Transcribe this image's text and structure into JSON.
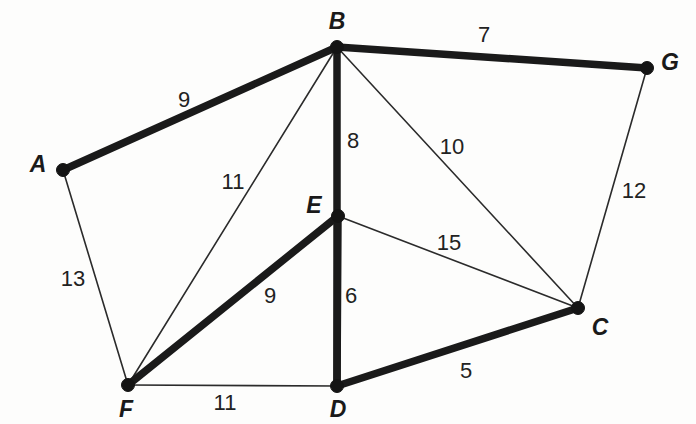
{
  "figure": {
    "type": "weighted-undirected-graph",
    "width": 696,
    "height": 424,
    "background_color": "#fdfdfc",
    "ink_color": "#1a1a1a"
  },
  "vertices": [
    {
      "id": "A",
      "label": "A",
      "x": 63,
      "y": 170,
      "label_x": 38,
      "label_y": 164
    },
    {
      "id": "B",
      "label": "B",
      "x": 337,
      "y": 47,
      "label_x": 337,
      "label_y": 21
    },
    {
      "id": "C",
      "label": "C",
      "x": 578,
      "y": 308,
      "label_x": 600,
      "label_y": 327
    },
    {
      "id": "D",
      "label": "D",
      "x": 337,
      "y": 386,
      "label_x": 338,
      "label_y": 409
    },
    {
      "id": "E",
      "label": "E",
      "x": 338,
      "y": 216,
      "label_x": 314,
      "label_y": 205
    },
    {
      "id": "F",
      "label": "F",
      "x": 128,
      "y": 385,
      "label_x": 126,
      "label_y": 409
    },
    {
      "id": "G",
      "label": "G",
      "x": 647,
      "y": 68,
      "label_x": 670,
      "label_y": 62
    }
  ],
  "edges": [
    {
      "from": "A",
      "to": "B",
      "weight": 9,
      "weight_x": 184,
      "weight_y": 100,
      "style": "thick"
    },
    {
      "from": "B",
      "to": "G",
      "weight": 7,
      "weight_x": 484,
      "weight_y": 35,
      "style": "thick"
    },
    {
      "from": "B",
      "to": "D",
      "weight": 8,
      "weight_x": 353,
      "weight_y": 141,
      "style": "thick"
    },
    {
      "from": "E",
      "to": "F",
      "weight": 9,
      "weight_x": 270,
      "weight_y": 296,
      "style": "thick"
    },
    {
      "from": "E",
      "to": "D",
      "weight": 6,
      "weight_x": 351,
      "weight_y": 296,
      "style": "thick"
    },
    {
      "from": "D",
      "to": "C",
      "weight": 5,
      "weight_x": 466,
      "weight_y": 371,
      "style": "thick"
    },
    {
      "from": "A",
      "to": "F",
      "weight": 13,
      "weight_x": 73,
      "weight_y": 279,
      "style": "thin"
    },
    {
      "from": "B",
      "to": "F",
      "weight": 11,
      "weight_x": 233,
      "weight_y": 182,
      "style": "thin"
    },
    {
      "from": "B",
      "to": "C",
      "weight": 10,
      "weight_x": 452,
      "weight_y": 147,
      "style": "thin"
    },
    {
      "from": "E",
      "to": "C",
      "weight": 15,
      "weight_x": 449,
      "weight_y": 243,
      "style": "thin"
    },
    {
      "from": "G",
      "to": "C",
      "weight": 12,
      "weight_x": 634,
      "weight_y": 191,
      "style": "thin"
    },
    {
      "from": "F",
      "to": "D",
      "weight": 11,
      "weight_x": 225,
      "weight_y": 403,
      "style": "thin"
    }
  ],
  "vertex_dot_radius": 6.5
}
